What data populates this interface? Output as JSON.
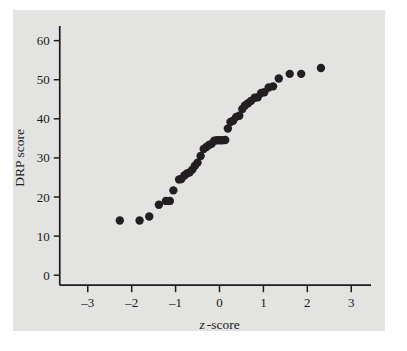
{
  "figure": {
    "background_color": "#e3e3e1",
    "page_color": "#ffffff",
    "point_color": "#231f20",
    "axis_color": "#1c1c1c"
  },
  "chart_data": {
    "type": "scatter",
    "title": "",
    "xlabel": "z -score",
    "xlabel_italic_part": "z",
    "xlabel_rest": "-score",
    "ylabel": "DRP score",
    "xlim": [
      -3.45,
      3.45
    ],
    "ylim": [
      -2,
      64
    ],
    "xticks": [
      -3,
      -2,
      -1,
      0,
      1,
      2,
      3
    ],
    "xticklabels": [
      "–3",
      "–2",
      "–1",
      "0",
      "1",
      "2",
      "3"
    ],
    "yticks": [
      0,
      10,
      20,
      30,
      40,
      50,
      60
    ],
    "yticklabels": [
      "0",
      "10",
      "20",
      "30",
      "40",
      "50",
      "60"
    ],
    "grid": false,
    "legend": false,
    "series": [
      {
        "name": "DRP normal quantile plot",
        "marker": "filled-circle",
        "marker_size": 4.2,
        "points": [
          [
            -2.27,
            14.0
          ],
          [
            -1.82,
            14.0
          ],
          [
            -1.6,
            15.0
          ],
          [
            -1.38,
            18.0
          ],
          [
            -1.22,
            19.0
          ],
          [
            -1.13,
            19.0
          ],
          [
            -1.05,
            21.7
          ],
          [
            -0.92,
            24.5
          ],
          [
            -0.87,
            24.6
          ],
          [
            -0.8,
            25.5
          ],
          [
            -0.74,
            26.0
          ],
          [
            -0.68,
            26.3
          ],
          [
            -0.62,
            27.0
          ],
          [
            -0.56,
            28.0
          ],
          [
            -0.5,
            28.8
          ],
          [
            -0.43,
            30.5
          ],
          [
            -0.36,
            32.3
          ],
          [
            -0.3,
            32.8
          ],
          [
            -0.24,
            33.3
          ],
          [
            -0.18,
            33.6
          ],
          [
            -0.12,
            34.4
          ],
          [
            -0.06,
            34.5
          ],
          [
            0.0,
            34.5
          ],
          [
            0.06,
            34.5
          ],
          [
            0.13,
            34.6
          ],
          [
            0.19,
            37.5
          ],
          [
            0.25,
            39.2
          ],
          [
            0.31,
            39.5
          ],
          [
            0.38,
            40.5
          ],
          [
            0.45,
            40.8
          ],
          [
            0.52,
            42.5
          ],
          [
            0.58,
            43.4
          ],
          [
            0.65,
            44.0
          ],
          [
            0.72,
            44.6
          ],
          [
            0.8,
            45.4
          ],
          [
            0.87,
            45.5
          ],
          [
            0.95,
            46.6
          ],
          [
            1.02,
            46.8
          ],
          [
            1.12,
            48.0
          ],
          [
            1.22,
            48.3
          ],
          [
            1.35,
            50.3
          ],
          [
            1.6,
            51.5
          ],
          [
            1.86,
            51.5
          ],
          [
            2.31,
            53.0
          ]
        ]
      }
    ]
  }
}
